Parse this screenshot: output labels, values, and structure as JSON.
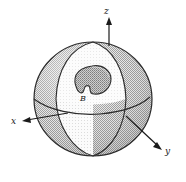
{
  "figure": {
    "kind": "line-diagram",
    "background_color": "#ffffff",
    "labels": {
      "z_axis": "z",
      "x_axis": "x",
      "y_axis": "y",
      "region": "B"
    },
    "colors": {
      "outline": "#2b2b2b",
      "sphere_outer_fill": "#bdbdbd",
      "cut_face_fill": "#f2f2f2",
      "cavity_fill": "#a8a8a8",
      "axis_line": "#1b1b1b",
      "label_text": "#1b1b1b"
    },
    "geometry": {
      "sphere_center_x": 93,
      "sphere_center_y": 99,
      "sphere_radius_x": 59,
      "sphere_radius_y": 57,
      "north_pole_x": 93,
      "north_pole_y": 42,
      "z_axis_tip_y": 18,
      "x_axis_tip_x": 22,
      "x_axis_tip_y": 121,
      "y_axis_tip_x": 161,
      "y_axis_tip_y": 148
    },
    "parts": [
      {
        "name": "outer-sphere",
        "description": "stippled gray sphere body"
      },
      {
        "name": "cut-wedge-face",
        "description": "light octant cut away from front-left"
      },
      {
        "name": "equator-curve",
        "description": "ellipse arc across sphere middle"
      },
      {
        "name": "meridian-left",
        "description": "vertical great-circle arc on left"
      },
      {
        "name": "meridian-right",
        "description": "vertical great-circle arc on right"
      },
      {
        "name": "cavity-B",
        "description": "bean shaped interior region labeled B"
      }
    ]
  }
}
